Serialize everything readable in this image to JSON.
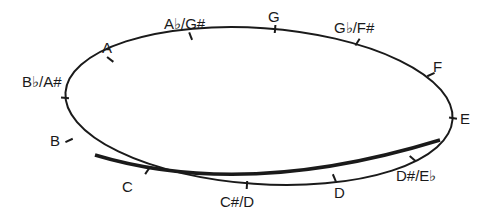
{
  "diagram": {
    "type": "cycle of pitches on an ellipse",
    "stroke_color": "#1a1a1a",
    "background": "#ffffff",
    "nodes": [
      {
        "label": "G",
        "x": 275,
        "y": 30,
        "lx": 268,
        "ly": 22
      },
      {
        "label": "G♭/F#",
        "x": 357,
        "y": 43,
        "lx": 334,
        "ly": 33
      },
      {
        "label": "F",
        "x": 430,
        "y": 75,
        "lx": 433,
        "ly": 72
      },
      {
        "label": "E",
        "x": 452,
        "y": 118,
        "lx": 460,
        "ly": 124
      },
      {
        "label": "D#/E♭",
        "x": 412,
        "y": 158,
        "lx": 396,
        "ly": 181
      },
      {
        "label": "D",
        "x": 334,
        "y": 177,
        "lx": 334,
        "ly": 198
      },
      {
        "label": "C#/D",
        "x": 247,
        "y": 184,
        "lx": 220,
        "ly": 207
      },
      {
        "label": "C",
        "x": 148,
        "y": 170,
        "lx": 122,
        "ly": 192
      },
      {
        "label": "B",
        "x": 70,
        "y": 140,
        "lx": 50,
        "ly": 146
      },
      {
        "label": "B♭/A#",
        "x": 66,
        "y": 98,
        "lx": 22,
        "ly": 87
      },
      {
        "label": "A",
        "x": 111,
        "y": 60,
        "lx": 102,
        "ly": 53
      },
      {
        "label": "A♭/G#",
        "x": 191,
        "y": 37,
        "lx": 164,
        "ly": 29
      }
    ]
  }
}
